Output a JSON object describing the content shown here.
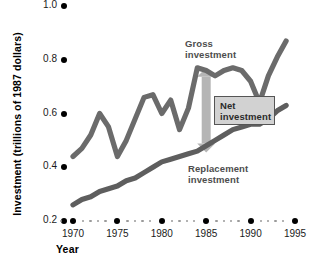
{
  "chart_data": {
    "type": "line",
    "title": "",
    "xlabel": "Year",
    "ylabel": "Investment (trillions of 1987 dollars)",
    "xlim": [
      1969,
      1995.5
    ],
    "ylim": [
      0.2,
      1.0
    ],
    "xticks": [
      1970,
      1975,
      1980,
      1985,
      1990,
      1995
    ],
    "xtick_labels": [
      "1970",
      "1975",
      "1980",
      "1985",
      "1990",
      "1995"
    ],
    "yticks": [
      0.2,
      0.4,
      0.6,
      0.8,
      1.0
    ],
    "ytick_labels": [
      "0.2",
      "0.4",
      "0.6",
      "0.8",
      "1.0"
    ],
    "grid": false,
    "legend_position": "inline-annotations",
    "x": [
      1970,
      1971,
      1972,
      1973,
      1974,
      1975,
      1976,
      1977,
      1978,
      1979,
      1980,
      1981,
      1982,
      1983,
      1984,
      1985,
      1986,
      1987,
      1988,
      1989,
      1990,
      1991,
      1992,
      1993,
      1994
    ],
    "series": [
      {
        "name": "Gross investment",
        "color": "#6b6b6b",
        "values": [
          0.44,
          0.47,
          0.52,
          0.6,
          0.55,
          0.44,
          0.5,
          0.58,
          0.66,
          0.67,
          0.6,
          0.65,
          0.54,
          0.62,
          0.77,
          0.76,
          0.74,
          0.76,
          0.77,
          0.76,
          0.72,
          0.64,
          0.74,
          0.81,
          0.87
        ]
      },
      {
        "name": "Replacement investment",
        "color": "#5e5e5e",
        "values": [
          0.26,
          0.28,
          0.29,
          0.31,
          0.32,
          0.33,
          0.35,
          0.36,
          0.38,
          0.4,
          0.42,
          0.43,
          0.44,
          0.45,
          0.46,
          0.48,
          0.5,
          0.52,
          0.54,
          0.55,
          0.56,
          0.56,
          0.58,
          0.61,
          0.63
        ]
      }
    ],
    "annotations": [
      {
        "name": "gross-investment-label",
        "text_line1": "Gross",
        "text_line2": "investment"
      },
      {
        "name": "replacement-investment-label",
        "text_line1": "Replacement",
        "text_line2": "investment"
      },
      {
        "name": "net-investment-callout",
        "text_line1": "Net",
        "text_line2": "investment",
        "arrow": {
          "at_year": 1985,
          "from_value": 0.77,
          "to_value": 0.455,
          "color": "#b5b5b5",
          "double_headed": true
        }
      }
    ]
  },
  "labels": {
    "y_axis_title": "Investment (trillions of 1987 dollars)",
    "x_axis_title": "Year",
    "gross_line1": "Gross",
    "gross_line2": "investment",
    "replacement_line1": "Replacement",
    "replacement_line2": "investment",
    "net_line1": "Net",
    "net_line2": "investment"
  },
  "ytick_labels": [
    "0.2",
    "0.4",
    "0.6",
    "0.8",
    "1.0"
  ],
  "xtick_labels": [
    "1970",
    "1975",
    "1980",
    "1985",
    "1990",
    "1995"
  ]
}
